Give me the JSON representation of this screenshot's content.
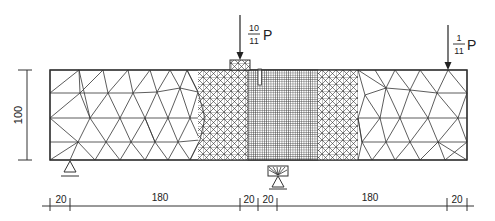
{
  "diagram": {
    "type": "finite-element-mesh",
    "colors": {
      "line": "#333333",
      "fine_mesh": "#444444",
      "background": "#ffffff"
    },
    "loads": [
      {
        "id": "load-main",
        "numerator": "10",
        "denominator": "11",
        "symbol": "P"
      },
      {
        "id": "load-right",
        "numerator": "1",
        "denominator": "11",
        "symbol": "P"
      }
    ],
    "dimensions": {
      "height": "100",
      "bottom": [
        "20",
        "180",
        "20",
        "20",
        "180",
        "20"
      ]
    },
    "supports": [
      {
        "id": "support-left",
        "type": "pin"
      },
      {
        "id": "support-center",
        "type": "pin-with-plate"
      }
    ]
  }
}
